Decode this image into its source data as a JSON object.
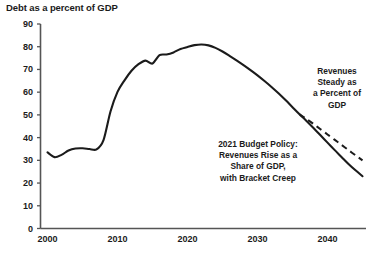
{
  "chart_data": {
    "type": "line",
    "title": "Debt as a percent of GDP",
    "xlabel": "",
    "ylabel": "",
    "xlim": [
      1999,
      2045.5
    ],
    "ylim": [
      0,
      90
    ],
    "yticks": [
      0,
      10,
      20,
      30,
      40,
      50,
      60,
      70,
      80,
      90
    ],
    "xticks": [
      2000,
      2010,
      2020,
      2030,
      2040
    ],
    "ytick_labels": [
      "0",
      "10",
      "20",
      "30",
      "40",
      "50",
      "60",
      "70",
      "80",
      "90"
    ],
    "xtick_labels": [
      "2000",
      "2010",
      "2020",
      "2030",
      "2040"
    ],
    "grid": false,
    "legend": null,
    "series": [
      {
        "name": "2021 Budget Policy: Revenues Rise as a Share of GDP, with Bracket Creep",
        "style": "solid",
        "color": "#1b1b1b",
        "x": [
          2000,
          2001,
          2002,
          2003,
          2004,
          2005,
          2006,
          2007,
          2008,
          2009,
          2010,
          2011,
          2012,
          2013,
          2014,
          2015,
          2016,
          2017,
          2018,
          2019,
          2020,
          2021,
          2022,
          2023,
          2024,
          2025,
          2026,
          2027,
          2028,
          2029,
          2030,
          2031,
          2032,
          2033,
          2034,
          2035,
          2036,
          2037,
          2038,
          2039,
          2040,
          2041,
          2042,
          2043,
          2044,
          2045
        ],
        "y": [
          33.5,
          31.4,
          32.4,
          34.3,
          35.2,
          35.3,
          35.0,
          34.8,
          38.9,
          51.5,
          60.1,
          65.2,
          69.4,
          72.3,
          73.9,
          72.6,
          76.3,
          76.6,
          77.5,
          79.0,
          79.9,
          80.7,
          81.0,
          80.6,
          79.5,
          77.9,
          76.0,
          74.0,
          71.9,
          69.7,
          67.4,
          64.9,
          62.3,
          59.5,
          56.5,
          53.4,
          50.3,
          47.3,
          44.2,
          41.0,
          37.8,
          34.6,
          31.5,
          28.4,
          25.6,
          23.0
        ]
      },
      {
        "name": "Revenues Steady as a Percent of GDP",
        "style": "dashed",
        "color": "#1b1b1b",
        "x": [
          2036,
          2037,
          2038,
          2039,
          2040,
          2041,
          2042,
          2043,
          2044,
          2045
        ],
        "y": [
          50.3,
          48.2,
          46.0,
          43.7,
          41.4,
          39.1,
          36.8,
          34.5,
          32.2,
          30.0
        ]
      }
    ],
    "annotations": [
      {
        "id": "revenues-steady",
        "lines": [
          "Revenues",
          "Steady as",
          "a Percent of",
          "GDP"
        ]
      },
      {
        "id": "budget-policy",
        "lines": [
          "2021 Budget Policy:",
          "Revenues Rise as a",
          "Share of GDP,",
          "with Bracket Creep"
        ]
      }
    ]
  },
  "axis": {
    "y_labels": [
      "90",
      "80",
      "70",
      "60",
      "50",
      "40",
      "30",
      "20",
      "10",
      "0"
    ],
    "x_labels": [
      "2000",
      "2010",
      "2020",
      "2030",
      "2040"
    ]
  },
  "annotations": {
    "revenues_steady": "Revenues\nSteady as\na Percent of\nGDP",
    "revenues_steady_l1": "Revenues",
    "revenues_steady_l2": "Steady as",
    "revenues_steady_l3": "a Percent of",
    "revenues_steady_l4": "GDP",
    "budget_policy_l1": "2021 Budget Policy:",
    "budget_policy_l2": "Revenues Rise as a",
    "budget_policy_l3": "Share of GDP,",
    "budget_policy_l4": "with Bracket Creep"
  },
  "colors": {
    "line": "#1b1b1b",
    "axis": "#555555",
    "text": "#1b1b1b",
    "background": "#ffffff"
  }
}
